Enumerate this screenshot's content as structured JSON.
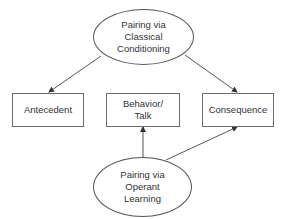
{
  "diagram": {
    "nodes": {
      "classical": {
        "shape": "ellipse",
        "lines": [
          "Pairing via",
          "Classical",
          "Conditioning"
        ]
      },
      "antecedent": {
        "shape": "rectangle",
        "lines": [
          "Antecedent"
        ]
      },
      "behavior": {
        "shape": "rectangle",
        "lines": [
          "Behavior/",
          "Talk"
        ]
      },
      "consequence": {
        "shape": "rectangle",
        "lines": [
          "Consequence"
        ]
      },
      "operant": {
        "shape": "ellipse",
        "lines": [
          "Pairing via",
          "Operant",
          "Learning"
        ]
      }
    },
    "edges": [
      {
        "from": "classical",
        "to": "antecedent"
      },
      {
        "from": "classical",
        "to": "consequence"
      },
      {
        "from": "operant",
        "to": "behavior"
      },
      {
        "from": "operant",
        "to": "consequence"
      }
    ],
    "colors": {
      "stroke": "#555555",
      "text": "#333333",
      "background": "#ffffff"
    }
  }
}
